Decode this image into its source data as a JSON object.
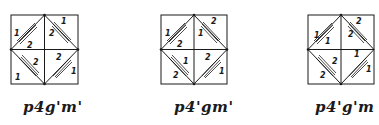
{
  "figure": {
    "panels": [
      {
        "caption": "p4g'm'",
        "labels": {
          "tl_outer": "1",
          "tl_inner": "2",
          "tr_outer": "1",
          "tr_inner": "2",
          "bl_outer": "1",
          "bl_inner": "2",
          "br_outer": "1",
          "br_inner": "2"
        }
      },
      {
        "caption": "p4'gm'",
        "labels": {
          "tl_outer": "1",
          "tl_inner": "2",
          "tr_outer": "2",
          "tr_inner": "1",
          "bl_outer": "2",
          "bl_inner": "1",
          "br_outer": "1",
          "br_inner": "2"
        }
      },
      {
        "caption": "p4'g'm",
        "labels": {
          "tl_outer": "1",
          "tl_inner": "1",
          "tr_outer": "2",
          "tr_inner": "2",
          "bl_outer": "2",
          "bl_inner": "2",
          "br_outer": "1",
          "br_inner": "1"
        }
      }
    ]
  },
  "colors": {
    "ink": "#1a1a1a",
    "background": "#ffffff"
  }
}
